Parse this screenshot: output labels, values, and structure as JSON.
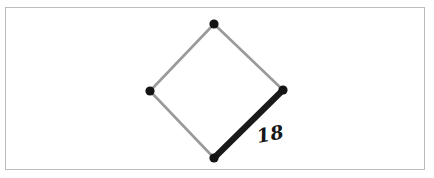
{
  "figure": {
    "frame": {
      "border_color": "#bcbcbc",
      "background_color": "#ffffff",
      "x": 5,
      "y": 7,
      "width": 420,
      "height": 163
    },
    "colors": {
      "plain_edge": "#9a9a9a",
      "highlight_edge": "#1a1a1a",
      "vertex": "#141414",
      "label_text": "#161616",
      "canvas": "#ffffff"
    },
    "strokes": {
      "plain_edge_width": 2.6,
      "highlight_edge_width": 6.2,
      "vertex_radius": 4.6
    }
  },
  "shape": {
    "name": "rhombus",
    "vertex_count": 4,
    "vertices": [
      {
        "id": "top",
        "label": "top-vertex",
        "x": 214,
        "y": 24
      },
      {
        "id": "right",
        "label": "right-vertex",
        "x": 283,
        "y": 90
      },
      {
        "id": "bottom",
        "label": "bottom-vertex",
        "x": 214,
        "y": 158
      },
      {
        "id": "left",
        "label": "left-vertex",
        "x": 150,
        "y": 91
      }
    ],
    "edges": [
      {
        "id": "top-left-edge",
        "from": "left",
        "to": "top",
        "style": "plain",
        "label": ""
      },
      {
        "id": "top-right-edge",
        "from": "top",
        "to": "right",
        "style": "plain",
        "label": ""
      },
      {
        "id": "bottom-left-edge",
        "from": "bottom",
        "to": "left",
        "style": "plain",
        "label": ""
      },
      {
        "id": "bottom-right-edge",
        "from": "bottom",
        "to": "right",
        "style": "highlight",
        "label": "18"
      }
    ]
  },
  "labels": {
    "side_measure": {
      "text": "18",
      "x": 258,
      "y": 143,
      "rotation": -10
    }
  },
  "chart_data": {
    "type": "diagram",
    "shape": "rhombus",
    "points": [
      {
        "name": "top",
        "x": 214,
        "y": 24
      },
      {
        "name": "right",
        "x": 283,
        "y": 90
      },
      {
        "name": "bottom",
        "x": 214,
        "y": 158
      },
      {
        "name": "left",
        "x": 150,
        "y": 91
      }
    ],
    "segments": [
      {
        "from": "left",
        "to": "top",
        "emphasis": false,
        "label": ""
      },
      {
        "from": "top",
        "to": "right",
        "emphasis": false,
        "label": ""
      },
      {
        "from": "bottom",
        "to": "left",
        "emphasis": false,
        "label": ""
      },
      {
        "from": "bottom",
        "to": "right",
        "emphasis": true,
        "label": "18"
      }
    ],
    "annotations": [
      {
        "text": "18",
        "x": 258,
        "y": 143
      }
    ],
    "grid": false,
    "legend": false
  }
}
